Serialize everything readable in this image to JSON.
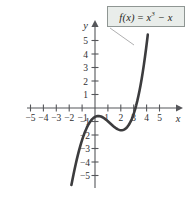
{
  "figure": {
    "background_color": "#ffffff",
    "curve_color": "#3c3c3e",
    "axis_color": "#55565a",
    "callout_fill": "#e9edea",
    "callout_border": "#8f9693",
    "leader_color": "#9a9a9c"
  },
  "callout": {
    "name": "function-label",
    "fx_part": "f(x)",
    "equals": " = ",
    "base": "x",
    "exponent": "3",
    "tail": " − x",
    "full_text": "f(x) = x³ − x"
  },
  "axes": {
    "x_name": "x",
    "y_name": "y",
    "x_tick_labels": [
      "−5",
      "−4",
      "−3",
      "−2",
      "−1",
      "1",
      "2",
      "3",
      "4",
      "5"
    ],
    "y_tick_labels": [
      "5",
      "4",
      "3",
      "2",
      "1",
      "−1",
      "−2",
      "−3",
      "−4",
      "−5"
    ]
  },
  "chart_data": {
    "type": "line",
    "title": "",
    "subtitle": "",
    "xlabel": "x",
    "ylabel": "y",
    "xlim": [
      -5.8,
      5.8
    ],
    "ylim": [
      -5.8,
      5.8
    ],
    "grid": false,
    "legend_position": "callout-box-top-right",
    "annotations": [
      {
        "text": "f(x) = x³ − x",
        "kind": "callout-with-leader-line",
        "points_to_x": 1.8,
        "points_to_y": 4.0
      }
    ],
    "series": [
      {
        "name": "f(x) = x³ − x",
        "equation": "y = x^3 - x",
        "color": "#3c3c3e",
        "domain": [
          -1.82,
          1.82
        ],
        "x": [
          -1.82,
          -1.7,
          -1.6,
          -1.5,
          -1.4,
          -1.3,
          -1.2,
          -1.1,
          -1.0,
          -0.9,
          -0.8,
          -0.7,
          -0.577,
          -0.5,
          -0.4,
          -0.3,
          -0.2,
          -0.1,
          0.0,
          0.1,
          0.2,
          0.3,
          0.4,
          0.5,
          0.577,
          0.7,
          0.8,
          0.9,
          1.0,
          1.1,
          1.2,
          1.3,
          1.4,
          1.5,
          1.6,
          1.7,
          1.82
        ],
        "y": [
          -4.21,
          -3.21,
          -2.5,
          -1.88,
          -1.34,
          -0.9,
          -0.53,
          -0.22,
          0.0,
          0.17,
          0.29,
          0.36,
          0.385,
          0.375,
          0.336,
          0.273,
          0.192,
          0.099,
          0.0,
          -0.099,
          -0.192,
          -0.273,
          -0.336,
          -0.375,
          -0.385,
          -0.36,
          -0.29,
          -0.17,
          0.0,
          0.22,
          0.53,
          0.9,
          1.34,
          1.88,
          2.5,
          3.21,
          4.21
        ]
      }
    ],
    "features": {
      "roots": [
        -1,
        0,
        1
      ],
      "local_max": {
        "x": -0.577,
        "y": 0.385
      },
      "local_min": {
        "x": 0.577,
        "y": -0.385
      },
      "inflection": {
        "x": 0,
        "y": 0
      }
    }
  }
}
